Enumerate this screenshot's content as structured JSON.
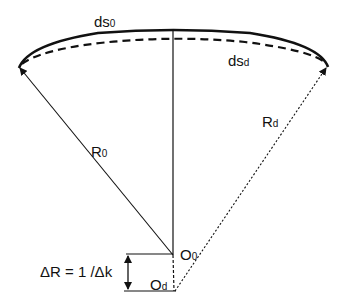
{
  "diagram": {
    "labels": {
      "ds0": {
        "main": "ds",
        "sub": "0"
      },
      "dsd": {
        "main": "ds",
        "sub": "d"
      },
      "R0": {
        "main": "R",
        "sub": "0"
      },
      "Rd": {
        "main": "R",
        "sub": "d"
      },
      "O0": {
        "main": "O",
        "sub": "0"
      },
      "Od": {
        "main": "O",
        "sub": "d"
      },
      "deltaR": "ΔR = 1 /Δk"
    },
    "colors": {
      "stroke": "#111111",
      "background": "#ffffff"
    }
  }
}
